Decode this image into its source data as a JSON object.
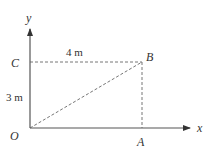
{
  "diagram": {
    "axes": {
      "x_label": "x",
      "y_label": "y",
      "origin_label": "O"
    },
    "points": {
      "A": "A",
      "B": "B",
      "C": "C"
    },
    "dimensions": {
      "horizontal": "4 m",
      "vertical": "3 m"
    },
    "colors": {
      "axis": "#555555",
      "dashed": "#666666",
      "text": "#333333"
    }
  }
}
